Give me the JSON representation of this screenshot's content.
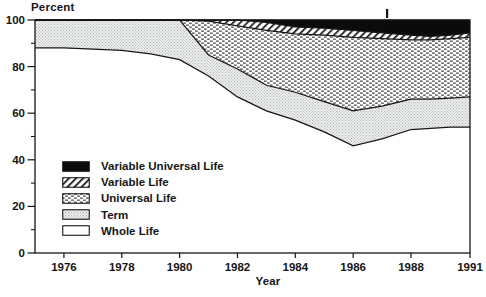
{
  "figure": {
    "background": "#ffffff",
    "ink_color": "#161616"
  },
  "chart_data": {
    "type": "area",
    "stacked": true,
    "units": "percent",
    "title": "",
    "ylabel": "Percent",
    "xlabel": "Year",
    "ylim": [
      0,
      100
    ],
    "grid": false,
    "legend_position": "inside-lower-left",
    "y_major_ticks": [
      0,
      20,
      40,
      60,
      80,
      100
    ],
    "y_minor_ticks": [
      10,
      30,
      50,
      70,
      90
    ],
    "x_ticks": [
      1976,
      1978,
      1980,
      1982,
      1984,
      1986,
      1988,
      1991
    ],
    "x_tick_labels": [
      "1976",
      "1978",
      "1980",
      "1982",
      "1984",
      "1986",
      "1988",
      "1991"
    ],
    "x": [
      1975,
      1976,
      1977,
      1978,
      1979,
      1980,
      1981,
      1982,
      1983,
      1984,
      1985,
      1986,
      1987,
      1988,
      1989,
      1990,
      1991
    ],
    "series": [
      {
        "name": "Whole Life",
        "pattern": "white",
        "values": [
          88,
          88,
          87.5,
          87,
          85.5,
          83,
          76,
          67,
          61,
          57,
          52,
          46,
          49,
          53,
          53.5,
          54,
          54
        ]
      },
      {
        "name": "Term",
        "pattern": "stipple",
        "values": [
          12,
          12,
          12.5,
          13,
          14.5,
          17,
          9,
          12,
          11,
          12,
          13,
          15,
          14,
          13,
          12.5,
          12.5,
          13
        ]
      },
      {
        "name": "Universal Life",
        "pattern": "dots",
        "values": [
          0,
          0,
          0,
          0,
          0,
          0,
          14.5,
          18.5,
          23.5,
          25,
          28.5,
          31.5,
          29,
          25.5,
          25.5,
          25.5,
          25.5
        ]
      },
      {
        "name": "Variable Life",
        "pattern": "hatch",
        "values": [
          0,
          0,
          0,
          0,
          0,
          0,
          0.5,
          2.5,
          3.5,
          3,
          3,
          3,
          2.5,
          2,
          1.5,
          1.5,
          2
        ]
      },
      {
        "name": "Variable Universal Life",
        "pattern": "black",
        "values": [
          0,
          0,
          0,
          0,
          0,
          0,
          0,
          0,
          1,
          3,
          3.5,
          4.5,
          5.5,
          6.5,
          7,
          6.5,
          5.5
        ]
      }
    ],
    "colors": {
      "black_fill": "#0b0b0b",
      "term_gray": "#dcdede",
      "line_ink": "#161616",
      "background": "#ffffff"
    }
  },
  "legend": {
    "items": [
      {
        "label": "Variable Universal Life",
        "swatch": "black"
      },
      {
        "label": "Variable Life",
        "swatch": "hatch"
      },
      {
        "label": "Universal Life",
        "swatch": "dots"
      },
      {
        "label": "Term",
        "swatch": "stipple"
      },
      {
        "label": "Whole Life",
        "swatch": "white"
      }
    ]
  }
}
